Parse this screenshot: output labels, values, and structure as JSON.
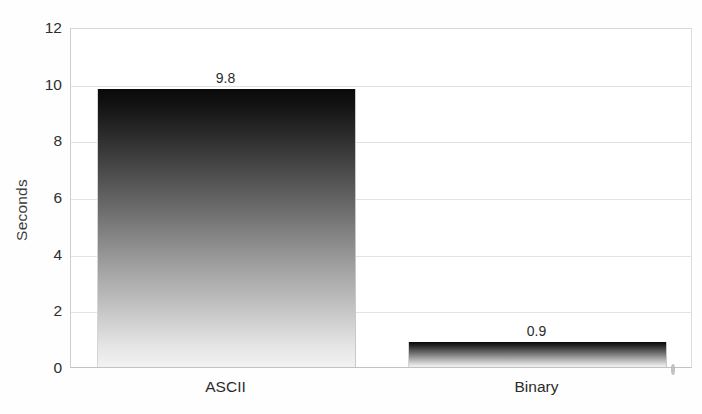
{
  "chart_data": {
    "type": "bar",
    "title": "",
    "subtitle": "",
    "xlabel": "",
    "ylabel": "Seconds",
    "categories": [
      "ASCII",
      "Binary"
    ],
    "values": [
      9.8,
      0.9
    ],
    "value_labels": [
      "9.8",
      "0.9"
    ],
    "ylim": [
      0,
      12
    ],
    "y_ticks": [
      0,
      2,
      4,
      6,
      8,
      10,
      12
    ],
    "y_tick_labels": [
      "0",
      "2",
      "4",
      "6",
      "8",
      "10",
      "12"
    ],
    "grid": true,
    "legend": false,
    "legend_position": "none",
    "series": [
      {
        "name": "Seconds",
        "values": [
          9.8,
          0.9
        ]
      }
    ],
    "bar_style": "vertical-gradient-dark-to-light",
    "colors": {
      "bar_top": "#0a0a0a",
      "bar_bottom": "#f2f2f2",
      "gridline": "#e3e3e3",
      "axis": "#c2c2c2",
      "text": "#2b2b2b",
      "background": "#ffffff"
    }
  },
  "annotations": {
    "scan_speck": "page-scan-artifact"
  }
}
